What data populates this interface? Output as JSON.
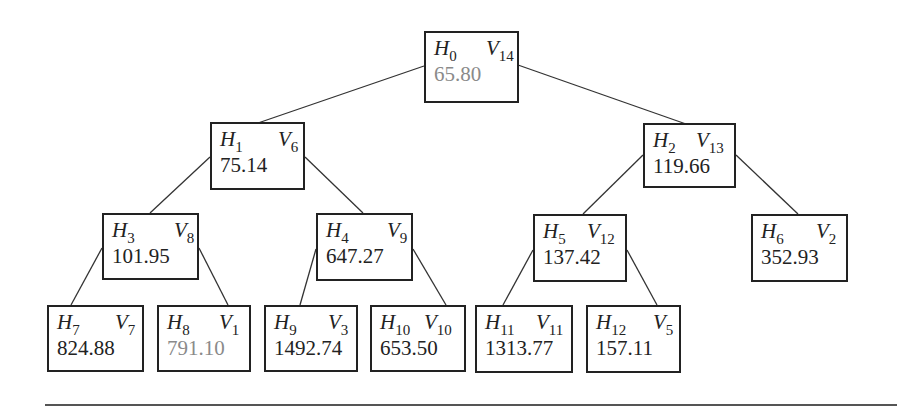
{
  "diagram": {
    "type": "binary-tree",
    "nodes": [
      {
        "id": "n0",
        "h": "0",
        "v": "14",
        "value": "65.80",
        "highlight": true,
        "box": [
          424,
          31,
          95,
          72
        ],
        "vx": 52
      },
      {
        "id": "n1",
        "h": "1",
        "v": "6",
        "value": "75.14",
        "highlight": false,
        "box": [
          210,
          122,
          95,
          68
        ],
        "vx": 58
      },
      {
        "id": "n2",
        "h": "2",
        "v": "13",
        "value": "119.66",
        "highlight": false,
        "box": [
          643,
          123,
          93,
          65
        ],
        "vx": 43
      },
      {
        "id": "n3",
        "h": "3",
        "v": "8",
        "value": "101.95",
        "highlight": false,
        "box": [
          102,
          213,
          97,
          67
        ],
        "vx": 62
      },
      {
        "id": "n4",
        "h": "4",
        "v": "9",
        "value": "647.27",
        "highlight": false,
        "box": [
          316,
          213,
          97,
          68
        ],
        "vx": 61
      },
      {
        "id": "n5",
        "h": "5",
        "v": "12",
        "value": "137.42",
        "highlight": false,
        "box": [
          533,
          214,
          94,
          68
        ],
        "vx": 44
      },
      {
        "id": "n6",
        "h": "6",
        "v": "2",
        "value": "352.93",
        "highlight": false,
        "box": [
          751,
          214,
          97,
          68
        ],
        "vx": 55
      },
      {
        "id": "n7",
        "h": "7",
        "v": "7",
        "value": "824.88",
        "highlight": false,
        "box": [
          47,
          305,
          97,
          67
        ],
        "vx": 58
      },
      {
        "id": "n8",
        "h": "8",
        "v": "1",
        "value": "791.10",
        "highlight": true,
        "box": [
          157,
          305,
          94,
          67
        ],
        "vx": 52
      },
      {
        "id": "n9",
        "h": "9",
        "v": "3",
        "value": "1492.74",
        "highlight": false,
        "box": [
          264,
          305,
          94,
          67
        ],
        "vx": 54
      },
      {
        "id": "n10",
        "h": "10",
        "v": "10",
        "value": "653.50",
        "highlight": false,
        "box": [
          370,
          305,
          96,
          67
        ],
        "vx": 44
      },
      {
        "id": "n11",
        "h": "11",
        "v": "11",
        "value": "1313.77",
        "highlight": false,
        "box": [
          475,
          305,
          98,
          68
        ],
        "vx": 51
      },
      {
        "id": "n12",
        "h": "12",
        "v": "5",
        "value": "157.11",
        "highlight": false,
        "box": [
          586,
          305,
          95,
          68
        ],
        "vx": 57
      }
    ],
    "edges": [
      {
        "from": "n0",
        "to": "n1",
        "p": [
          424,
          66,
          258,
          123
        ]
      },
      {
        "from": "n0",
        "to": "n2",
        "p": [
          518,
          65,
          686,
          124
        ]
      },
      {
        "from": "n1",
        "to": "n3",
        "p": [
          210,
          157,
          150,
          213
        ]
      },
      {
        "from": "n1",
        "to": "n4",
        "p": [
          305,
          157,
          363,
          213
        ]
      },
      {
        "from": "n2",
        "to": "n5",
        "p": [
          643,
          155,
          583,
          214
        ]
      },
      {
        "from": "n2",
        "to": "n6",
        "p": [
          736,
          155,
          798,
          214
        ]
      },
      {
        "from": "n3",
        "to": "n7",
        "p": [
          102,
          248,
          71,
          305
        ]
      },
      {
        "from": "n3",
        "to": "n8",
        "p": [
          199,
          248,
          228,
          305
        ]
      },
      {
        "from": "n4",
        "to": "n9",
        "p": [
          316,
          249,
          300,
          305
        ]
      },
      {
        "from": "n4",
        "to": "n10",
        "p": [
          413,
          249,
          446,
          305
        ]
      },
      {
        "from": "n5",
        "to": "n11",
        "p": [
          533,
          250,
          503,
          305
        ]
      },
      {
        "from": "n5",
        "to": "n12",
        "p": [
          627,
          250,
          657,
          305
        ]
      }
    ],
    "colors": {
      "normal_value": "#222222",
      "highlight_value": "#8a8a8a",
      "border": "#222222",
      "edge": "#333333"
    }
  }
}
